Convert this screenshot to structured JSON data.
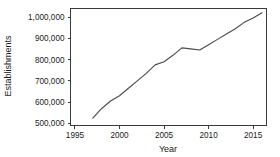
{
  "chart_data": {
    "type": "line",
    "title": "",
    "xlabel": "Year",
    "ylabel": "Establishments",
    "xlim": [
      1994.5,
      2016.5
    ],
    "ylim": [
      490000,
      1040000
    ],
    "grid": false,
    "legend": null,
    "xticks": [
      1995,
      2000,
      2005,
      2010,
      2015
    ],
    "xtick_labels": [
      "1995",
      "2000",
      "2005",
      "2010",
      "2015"
    ],
    "yticks": [
      500000,
      600000,
      700000,
      800000,
      900000,
      1000000
    ],
    "ytick_labels": [
      "500,000",
      "600,000",
      "700,000",
      "800,000",
      "900,000",
      "1,000,000"
    ],
    "series": [
      {
        "name": "Establishments",
        "x": [
          1997,
          1998,
          1999,
          2000,
          2001,
          2002,
          2003,
          2004,
          2005,
          2006,
          2007,
          2008,
          2009,
          2010,
          2011,
          2012,
          2013,
          2014,
          2015,
          2016
        ],
        "values": [
          525000,
          570000,
          605000,
          630000,
          665000,
          700000,
          735000,
          775000,
          790000,
          820000,
          855000,
          850000,
          845000,
          870000,
          895000,
          920000,
          945000,
          975000,
          995000,
          1020000
        ]
      }
    ]
  },
  "axes": {
    "y_title": "Establishments",
    "x_title": "Year"
  }
}
